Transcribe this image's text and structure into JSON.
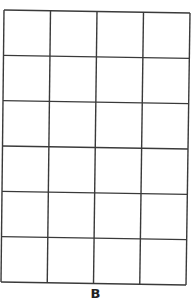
{
  "figure": {
    "label": "B",
    "grid": {
      "columns": 4,
      "rows": 6,
      "line_color": "#3a3a3a",
      "background": "#ffffff",
      "corners": {
        "top_left": [
          4,
          10
        ],
        "top_right": [
          190,
          13
        ],
        "bottom_left": [
          1,
          282
        ],
        "bottom_right": [
          186,
          285
        ]
      }
    }
  }
}
